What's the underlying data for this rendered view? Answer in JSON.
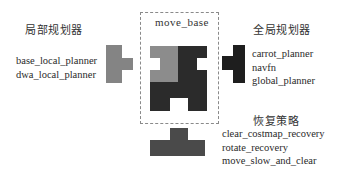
{
  "colors": {
    "background": "#ffffff",
    "local_piece": "#848484",
    "center_light": "#8c8c8c",
    "center_dark": "#2b2b2b",
    "global_piece": "#1e1e1e",
    "recovery_piece": "#4a4a4a",
    "dash_border": "#8a8a8a"
  },
  "local_planner": {
    "heading": "局部规划器",
    "items": [
      "base_local_planner",
      "dwa_local_planner"
    ]
  },
  "move_base": {
    "title": "move_base"
  },
  "global_planner": {
    "heading": "全局规划器",
    "items": [
      "carrot_planner",
      "navfn",
      "global_planner"
    ]
  },
  "recovery": {
    "heading": "恢复策略",
    "items": [
      "clear_costmap_recovery",
      "rotate_recovery",
      "move_slow_and_clear"
    ]
  }
}
